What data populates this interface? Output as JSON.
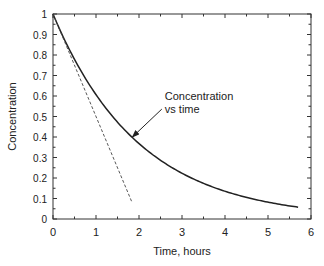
{
  "chart_data": {
    "type": "line",
    "title": "",
    "xlabel": "Time, hours",
    "ylabel": "Concentration",
    "xlim": [
      0,
      6
    ],
    "ylim": [
      0,
      1
    ],
    "x_ticks": [
      "0",
      "1",
      "2",
      "3",
      "4",
      "5",
      "6"
    ],
    "y_ticks": [
      "0",
      "0.1",
      "0.2",
      "0.3",
      "0.4",
      "0.5",
      "0.6",
      "0.7",
      "0.8",
      "0.9",
      "1"
    ],
    "grid": false,
    "legend": null,
    "series": [
      {
        "name": "Concentration vs time",
        "style": "solid",
        "x": [
          0,
          0.5,
          1,
          1.5,
          2,
          2.5,
          3,
          3.5,
          4,
          4.5,
          5,
          5.7
        ],
        "y": [
          1.0,
          0.78,
          0.61,
          0.47,
          0.37,
          0.29,
          0.22,
          0.17,
          0.135,
          0.105,
          0.082,
          0.058
        ]
      },
      {
        "name": "Initial slope (tangent)",
        "style": "dashed",
        "x": [
          0,
          1.83
        ],
        "y": [
          1.0,
          0.085
        ]
      }
    ],
    "annotations": [
      {
        "text_lines": [
          "Concentration",
          "vs time"
        ],
        "arrow_to": {
          "x": 1.8,
          "y": 0.395
        },
        "text_at": {
          "x": 2.6,
          "y": 0.58
        }
      }
    ]
  }
}
